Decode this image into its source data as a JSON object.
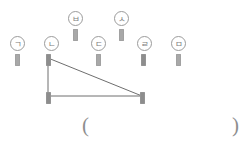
{
  "figure": {
    "peg_color": "#a8a8a8",
    "line_color": "#6e6e6e",
    "label_color": "#7d7d7d",
    "labels": [
      {
        "id": "giyeok",
        "text": "ㄱ",
        "cx": 17,
        "cy": 43,
        "peg_x": 15,
        "peg_y": 54
      },
      {
        "id": "nieun",
        "text": "ㄴ",
        "cx": 51,
        "cy": 43,
        "peg_x": 49,
        "peg_y": 54
      },
      {
        "id": "digeut",
        "text": "ㄷ",
        "cx": 98,
        "cy": 43,
        "peg_x": 96,
        "peg_y": 54
      },
      {
        "id": "rieul",
        "text": "ㄹ",
        "cx": 144,
        "cy": 43,
        "peg_x": 142,
        "peg_y": 54
      },
      {
        "id": "mieum",
        "text": "ㅁ",
        "cx": 178,
        "cy": 43,
        "peg_x": 176,
        "peg_y": 54
      },
      {
        "id": "bieup",
        "text": "ㅂ",
        "cx": 75,
        "cy": 18,
        "peg_x": 73,
        "peg_y": 30
      },
      {
        "id": "siot",
        "text": "ㅅ",
        "cx": 121,
        "cy": 18,
        "peg_x": 119,
        "peg_y": 30
      }
    ],
    "triangle": {
      "vertices": [
        {
          "name": "apex",
          "x": 48,
          "y": 58
        },
        {
          "name": "bottom-left",
          "x": 48,
          "y": 96
        },
        {
          "name": "bottom-right",
          "x": 142,
          "y": 96
        }
      ],
      "vertex_pegs": [
        {
          "x": 46,
          "y": 56
        },
        {
          "x": 46,
          "y": 92
        },
        {
          "x": 140,
          "y": 92
        }
      ]
    },
    "answer": {
      "open_paren": "(",
      "close_paren": ")",
      "value": "",
      "open_x": 82,
      "close_x": 232,
      "y": 124
    }
  }
}
